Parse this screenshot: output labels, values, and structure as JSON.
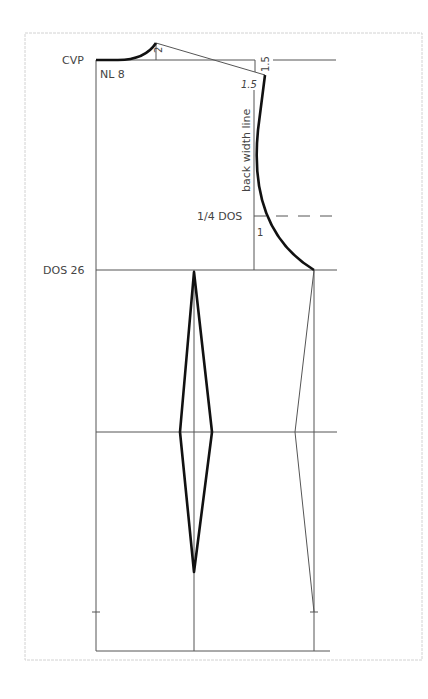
{
  "diagram": {
    "type": "pattern-draft",
    "colors": {
      "frame": "#cfcfcf",
      "construction": "#555555",
      "outline": "#111111",
      "text": "#444444"
    },
    "labels": {
      "cvp": "CVP",
      "neck_line": "NL 8",
      "shoulder_rise": "2",
      "shoulder_drop": "1.5",
      "shoulder_ext": "1.5",
      "back_width_line": "back width line",
      "quarter_dos": "1/4 DOS",
      "armhole_offset": "1",
      "dos": "DOS 26"
    }
  }
}
